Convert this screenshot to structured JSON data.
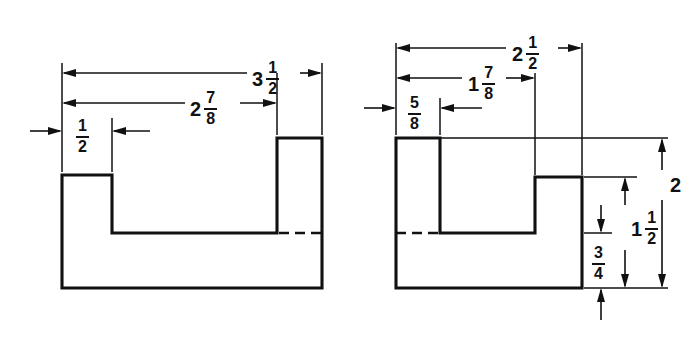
{
  "drawing": {
    "title": "Two-view orthographic drawing of a channel-shaped part",
    "units": "inches (fractional)",
    "line_color": "#111111",
    "background_color": "#ffffff",
    "views": [
      {
        "name": "left-view",
        "description": "Front view showing a short left tab, a wide low base and a tall right wall",
        "dimensions": [
          {
            "id": "overall-width",
            "label_whole": "3",
            "label_num": "1",
            "label_den": "2",
            "value": 3.5,
            "orientation": "horizontal",
            "position": "top"
          },
          {
            "id": "inner-width",
            "label_whole": "2",
            "label_num": "7",
            "label_den": "8",
            "value": 2.875,
            "orientation": "horizontal",
            "position": "top"
          },
          {
            "id": "left-tab-width",
            "label_whole": "",
            "label_num": "1",
            "label_den": "2",
            "value": 0.5,
            "orientation": "horizontal",
            "position": "top"
          }
        ]
      },
      {
        "name": "right-view",
        "description": "Side view showing a tall left wall, a low base and a short right tab",
        "dimensions": [
          {
            "id": "overall-width",
            "label_whole": "2",
            "label_num": "1",
            "label_den": "2",
            "value": 2.5,
            "orientation": "horizontal",
            "position": "top"
          },
          {
            "id": "inner-width",
            "label_whole": "1",
            "label_num": "7",
            "label_den": "8",
            "value": 1.875,
            "orientation": "horizontal",
            "position": "top"
          },
          {
            "id": "left-wall-width",
            "label_whole": "",
            "label_num": "5",
            "label_den": "8",
            "value": 0.625,
            "orientation": "horizontal",
            "position": "top"
          },
          {
            "id": "overall-height",
            "label_whole": "2",
            "label_num": "",
            "label_den": "",
            "value": 2,
            "orientation": "vertical",
            "position": "right"
          },
          {
            "id": "tab-height",
            "label_whole": "1",
            "label_num": "1",
            "label_den": "2",
            "value": 1.5,
            "orientation": "vertical",
            "position": "right"
          },
          {
            "id": "base-height",
            "label_whole": "",
            "label_num": "3",
            "label_den": "4",
            "value": 0.75,
            "orientation": "vertical",
            "position": "right"
          }
        ]
      }
    ]
  }
}
